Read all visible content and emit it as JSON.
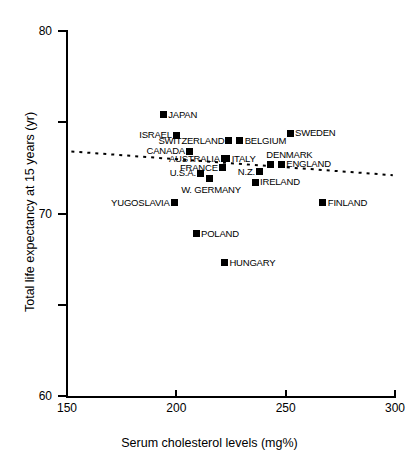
{
  "chart_data": {
    "type": "scatter",
    "title": "",
    "xlabel": "Serum cholesterol levels (mg%)",
    "ylabel": "Total life expectancy at 15 years (yr)",
    "xlim": [
      150,
      300
    ],
    "ylim": [
      60,
      80
    ],
    "xticks": [
      150,
      200,
      250,
      300
    ],
    "yticks": [
      60,
      70,
      80
    ],
    "xtick_labels": [
      "150",
      "200",
      "250",
      "300"
    ],
    "ytick_labels": [
      "60",
      "70",
      "80"
    ],
    "grid": false,
    "legend": "none",
    "marker": "filled-square",
    "points": [
      {
        "label": "JAPAN",
        "x": 194,
        "y": 75.4,
        "side": "right"
      },
      {
        "label": "ISRAEL",
        "x": 200,
        "y": 74.3,
        "side": "left"
      },
      {
        "label": "SWEDEN",
        "x": 252,
        "y": 74.4,
        "side": "right"
      },
      {
        "label": "SWITZERLAND",
        "x": 224,
        "y": 74.0,
        "side": "left"
      },
      {
        "label": "BELGIUM",
        "x": 229,
        "y": 74.0,
        "side": "right"
      },
      {
        "label": "CANADA",
        "x": 206,
        "y": 73.4,
        "side": "left"
      },
      {
        "label": "AUSTRALIA",
        "x": 222,
        "y": 73.0,
        "side": "left"
      },
      {
        "label": "ITALY",
        "x": 223,
        "y": 73.0,
        "side": "right"
      },
      {
        "label": "DENMARK",
        "x": 243,
        "y": 72.7,
        "side": "above"
      },
      {
        "label": "ENGLAND",
        "x": 248,
        "y": 72.7,
        "side": "right"
      },
      {
        "label": "FRANCE",
        "x": 221,
        "y": 72.5,
        "side": "left"
      },
      {
        "label": "N.Z.",
        "x": 238,
        "y": 72.3,
        "side": "left"
      },
      {
        "label": "U.S.A.",
        "x": 211,
        "y": 72.2,
        "side": "left"
      },
      {
        "label": "W. GERMANY",
        "x": 215,
        "y": 71.9,
        "side": "below"
      },
      {
        "label": "IRELAND",
        "x": 236,
        "y": 71.7,
        "side": "right"
      },
      {
        "label": "YUGOSLAVIA",
        "x": 199,
        "y": 70.6,
        "side": "left"
      },
      {
        "label": "FINLAND",
        "x": 267,
        "y": 70.6,
        "side": "right"
      },
      {
        "label": "POLAND",
        "x": 209,
        "y": 68.9,
        "side": "right"
      },
      {
        "label": "HUNGARY",
        "x": 222,
        "y": 67.3,
        "side": "right"
      }
    ],
    "trend_line": {
      "style": "dotted",
      "x_start": 152,
      "y_start": 73.4,
      "x_end": 299,
      "y_end": 72.1
    }
  }
}
